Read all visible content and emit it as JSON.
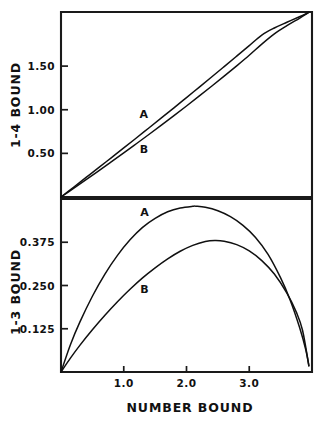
{
  "figure": {
    "background": "#ffffff",
    "ink_color": "#111111",
    "panels": [
      "top",
      "bottom"
    ]
  },
  "chart_data": [
    {
      "type": "line",
      "panel": "top",
      "title": "",
      "xlabel": "",
      "ylabel": "1-4 BOUND",
      "xlim": [
        0,
        4.0
      ],
      "ylim": [
        0,
        2.12
      ],
      "grid": false,
      "legend": "inline-curve-labels",
      "ytick_labels": [
        "1.50",
        "1.00",
        "0.50"
      ],
      "ytick_values": [
        1.5,
        1.0,
        0.5
      ],
      "xtick_labels": [],
      "xtick_values": [],
      "series": [
        {
          "name": "A",
          "label": "A",
          "label_x": 1.32,
          "label_y": 0.9,
          "x": [
            0.0,
            0.2,
            0.4,
            0.6,
            0.8,
            1.0,
            1.2,
            1.4,
            1.6,
            1.8,
            2.0,
            2.2,
            2.4,
            2.6,
            2.8,
            3.0,
            3.2,
            3.4,
            3.6,
            3.8,
            3.95
          ],
          "values": [
            0.0,
            0.112,
            0.224,
            0.336,
            0.449,
            0.562,
            0.676,
            0.791,
            0.906,
            1.022,
            1.139,
            1.257,
            1.375,
            1.494,
            1.614,
            1.735,
            1.856,
            1.937,
            2.002,
            2.065,
            2.115
          ]
        },
        {
          "name": "B",
          "label": "B",
          "label_x": 1.32,
          "label_y": 0.5,
          "x": [
            0.0,
            0.2,
            0.4,
            0.6,
            0.8,
            1.0,
            1.2,
            1.4,
            1.6,
            1.8,
            2.0,
            2.2,
            2.4,
            2.6,
            2.8,
            3.0,
            3.2,
            3.4,
            3.6,
            3.8,
            3.95
          ],
          "values": [
            0.0,
            0.099,
            0.199,
            0.3,
            0.402,
            0.505,
            0.61,
            0.716,
            0.823,
            0.932,
            1.043,
            1.155,
            1.269,
            1.385,
            1.503,
            1.624,
            1.752,
            1.869,
            1.963,
            2.048,
            2.115
          ]
        }
      ]
    },
    {
      "type": "line",
      "panel": "bottom",
      "title": "",
      "xlabel": "NUMBER BOUND",
      "ylabel": "1-3 BOUND",
      "xlim": [
        0,
        4.0
      ],
      "ylim": [
        0,
        0.5
      ],
      "grid": false,
      "legend": "inline-curve-labels",
      "ytick_labels": [
        "0.375",
        "0.250",
        "0.125"
      ],
      "ytick_values": [
        0.375,
        0.25,
        0.125
      ],
      "xtick_labels": [
        "1.0",
        "2.0",
        "3.0"
      ],
      "xtick_values": [
        1.0,
        2.0,
        3.0
      ],
      "series": [
        {
          "name": "A",
          "label": "A",
          "label_x": 1.33,
          "label_y": 0.452,
          "x": [
            0.0,
            0.15,
            0.3,
            0.5,
            0.7,
            0.9,
            1.1,
            1.3,
            1.5,
            1.7,
            1.9,
            2.1,
            2.15,
            2.3,
            2.5,
            2.7,
            2.9,
            3.1,
            3.3,
            3.5,
            3.65,
            3.8,
            3.9,
            3.95
          ],
          "values": [
            0.0,
            0.079,
            0.144,
            0.219,
            0.283,
            0.337,
            0.382,
            0.418,
            0.444,
            0.463,
            0.474,
            0.479,
            0.479,
            0.476,
            0.466,
            0.449,
            0.424,
            0.389,
            0.34,
            0.272,
            0.209,
            0.13,
            0.065,
            0.018
          ]
        },
        {
          "name": "B",
          "label": "B",
          "label_x": 1.33,
          "label_y": 0.228,
          "x": [
            0.0,
            0.15,
            0.3,
            0.5,
            0.7,
            0.9,
            1.1,
            1.3,
            1.5,
            1.7,
            1.9,
            2.1,
            2.3,
            2.45,
            2.6,
            2.8,
            3.0,
            3.2,
            3.4,
            3.6,
            3.75,
            3.85,
            3.95
          ],
          "values": [
            0.0,
            0.04,
            0.077,
            0.122,
            0.164,
            0.203,
            0.239,
            0.272,
            0.301,
            0.327,
            0.349,
            0.366,
            0.377,
            0.38,
            0.378,
            0.368,
            0.35,
            0.322,
            0.283,
            0.228,
            0.173,
            0.12,
            0.018
          ]
        }
      ]
    }
  ]
}
